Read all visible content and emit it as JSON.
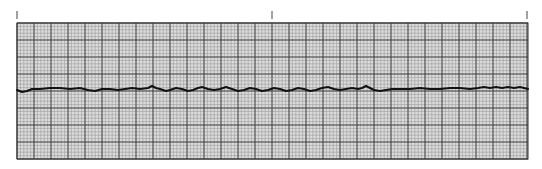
{
  "strip": {
    "kind": "ecg-rhythm-strip",
    "paper": {
      "left": 17,
      "top": 23,
      "right": 528,
      "bottom": 159,
      "minor_spacing_px": 3.4,
      "major_spacing_px": 17,
      "minor_color": "#9a9a9a",
      "major_color": "#3a3a3a",
      "background": "#dcdcdc"
    },
    "time_marks_x": [
      17,
      272,
      527
    ],
    "trace": {
      "color": "#111111",
      "baseline_y": 89,
      "points": [
        [
          17,
          90
        ],
        [
          22,
          92
        ],
        [
          27,
          91
        ],
        [
          32,
          89
        ],
        [
          40,
          89
        ],
        [
          50,
          88
        ],
        [
          60,
          88
        ],
        [
          70,
          89
        ],
        [
          80,
          88
        ],
        [
          88,
          90
        ],
        [
          95,
          91
        ],
        [
          102,
          89
        ],
        [
          110,
          89
        ],
        [
          118,
          90
        ],
        [
          125,
          89
        ],
        [
          132,
          88
        ],
        [
          140,
          89
        ],
        [
          148,
          88
        ],
        [
          152,
          86
        ],
        [
          156,
          88
        ],
        [
          160,
          89
        ],
        [
          166,
          91
        ],
        [
          170,
          90
        ],
        [
          176,
          88
        ],
        [
          182,
          89
        ],
        [
          188,
          91
        ],
        [
          193,
          90
        ],
        [
          198,
          88
        ],
        [
          202,
          87
        ],
        [
          208,
          89
        ],
        [
          214,
          90
        ],
        [
          220,
          89
        ],
        [
          226,
          87
        ],
        [
          232,
          89
        ],
        [
          238,
          91
        ],
        [
          244,
          90
        ],
        [
          250,
          88
        ],
        [
          256,
          89
        ],
        [
          262,
          91
        ],
        [
          268,
          90
        ],
        [
          274,
          88
        ],
        [
          280,
          89
        ],
        [
          286,
          91
        ],
        [
          292,
          90
        ],
        [
          298,
          88
        ],
        [
          304,
          89
        ],
        [
          310,
          91
        ],
        [
          316,
          90
        ],
        [
          322,
          88
        ],
        [
          328,
          87
        ],
        [
          334,
          89
        ],
        [
          340,
          90
        ],
        [
          346,
          89
        ],
        [
          352,
          88
        ],
        [
          358,
          89
        ],
        [
          362,
          88
        ],
        [
          366,
          86
        ],
        [
          370,
          88
        ],
        [
          374,
          90
        ],
        [
          380,
          91
        ],
        [
          386,
          90
        ],
        [
          392,
          89
        ],
        [
          400,
          89
        ],
        [
          410,
          89
        ],
        [
          420,
          88
        ],
        [
          430,
          89
        ],
        [
          440,
          89
        ],
        [
          450,
          88
        ],
        [
          460,
          88
        ],
        [
          470,
          89
        ],
        [
          478,
          88
        ],
        [
          484,
          87
        ],
        [
          490,
          88
        ],
        [
          496,
          87
        ],
        [
          502,
          88
        ],
        [
          508,
          87
        ],
        [
          514,
          88
        ],
        [
          520,
          87
        ],
        [
          524,
          88
        ],
        [
          528,
          89
        ]
      ]
    }
  }
}
